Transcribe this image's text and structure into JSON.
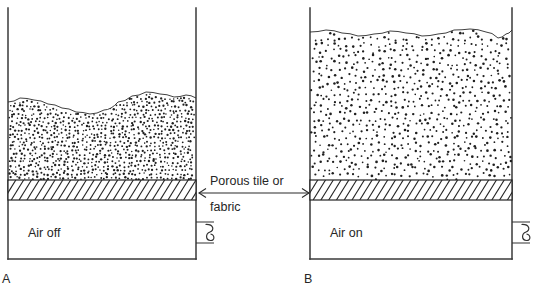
{
  "figure": {
    "background_color": "#ffffff",
    "line_color": "#2b2b2b",
    "particle_color": "#1f1f1f"
  },
  "center_label": {
    "line1": "Porous tile or",
    "line2": "fabric",
    "arrow": "double-headed-horizontal-arrow"
  },
  "panels": [
    {
      "id": "A",
      "letter": "A",
      "state_label": "Air off",
      "vessel": {
        "left": 8,
        "right": 196,
        "top": 8,
        "bottom": 259
      },
      "distributor_plate": {
        "top": 180,
        "bottom": 200,
        "hatch_style": "diagonal",
        "hatch_count": 24
      },
      "bed": {
        "state": "packed",
        "surface_top_y": 98,
        "surface_bottom_y": 180,
        "packing_density": "dense",
        "dot_spacing": 4.0,
        "dot_radius": 0.95,
        "surface_profile": [
          [
            8,
            102
          ],
          [
            20,
            98
          ],
          [
            34,
            100
          ],
          [
            48,
            104
          ],
          [
            62,
            108
          ],
          [
            76,
            112
          ],
          [
            90,
            114
          ],
          [
            104,
            110
          ],
          [
            118,
            102
          ],
          [
            132,
            96
          ],
          [
            146,
            92
          ],
          [
            160,
            94
          ],
          [
            174,
            97
          ],
          [
            186,
            95
          ],
          [
            196,
            98
          ]
        ]
      },
      "air_inlet": {
        "pipe_y_top": 222,
        "pipe_y_bottom": 243,
        "pipe_x_outer": 214,
        "valve": "bowtie-valve"
      }
    },
    {
      "id": "B",
      "letter": "B",
      "state_label": "Air on",
      "vessel": {
        "left": 310,
        "right": 512,
        "top": 8,
        "bottom": 259
      },
      "distributor_plate": {
        "top": 180,
        "bottom": 200,
        "hatch_style": "diagonal",
        "hatch_count": 26
      },
      "bed": {
        "state": "fluidized",
        "surface_top_y": 28,
        "surface_bottom_y": 180,
        "packing_density": "expanded",
        "dot_spacing": 6.2,
        "dot_radius": 1.05,
        "surface_profile": [
          [
            310,
            32
          ],
          [
            326,
            30
          ],
          [
            342,
            33
          ],
          [
            358,
            36
          ],
          [
            374,
            34
          ],
          [
            390,
            31
          ],
          [
            406,
            33
          ],
          [
            422,
            36
          ],
          [
            438,
            34
          ],
          [
            454,
            30
          ],
          [
            470,
            29
          ],
          [
            486,
            32
          ],
          [
            498,
            38
          ],
          [
            506,
            34
          ],
          [
            512,
            30
          ]
        ]
      },
      "air_inlet": {
        "pipe_y_top": 222,
        "pipe_y_bottom": 243,
        "pipe_x_outer": 530,
        "valve": "bowtie-valve"
      }
    }
  ]
}
